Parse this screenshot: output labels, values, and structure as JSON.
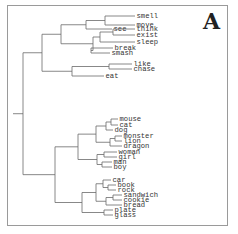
{
  "panel_label": "A",
  "tree": {
    "children": [
      {
        "children": [
          {
            "children": [
              {
                "children": [
                  {
                    "children": [
                      {
                        "label": "smell"
                      },
                      {
                        "label": "move"
                      }
                    ]
                  },
                  {
                    "label": "see"
                  }
                ]
              },
              {
                "children": [
                  {
                    "children": [
                      {
                        "children": [
                          {
                            "label": "think"
                          },
                          {
                            "label": "exist"
                          }
                        ]
                      },
                      {
                        "label": "sleep"
                      }
                    ]
                  },
                  {
                    "children": [
                      {
                        "label": "break"
                      },
                      {
                        "label": "smash"
                      }
                    ]
                  }
                ]
              }
            ]
          },
          {
            "children": [
              {
                "children": [
                  {
                    "label": "like"
                  },
                  {
                    "label": "chase"
                  }
                ]
              },
              {
                "label": "eat"
              }
            ]
          }
        ]
      },
      {
        "children": [
          {
            "children": [
              {
                "children": [
                  {
                    "children": [
                      {
                        "children": [
                          {
                            "label": "mouse"
                          },
                          {
                            "label": "cat"
                          }
                        ]
                      },
                      {
                        "label": "dog"
                      }
                    ]
                  },
                  {
                    "children": [
                      {
                        "children": [
                          {
                            "label": "monster"
                          },
                          {
                            "label": "lion"
                          }
                        ]
                      },
                      {
                        "label": "dragon"
                      }
                    ]
                  }
                ]
              },
              {
                "children": [
                  {
                    "children": [
                      {
                        "label": "woman"
                      },
                      {
                        "label": "girl"
                      }
                    ]
                  },
                  {
                    "children": [
                      {
                        "label": "man"
                      },
                      {
                        "label": "boy"
                      }
                    ]
                  }
                ]
              }
            ]
          },
          {
            "children": [
              {
                "children": [
                  {
                    "children": [
                      {
                        "label": "car"
                      },
                      {
                        "children": [
                          {
                            "label": "book"
                          },
                          {
                            "label": "rock"
                          }
                        ]
                      }
                    ]
                  },
                  {
                    "children": [
                      {
                        "children": [
                          {
                            "label": "sandwich"
                          },
                          {
                            "label": "cookie"
                          }
                        ]
                      },
                      {
                        "label": "bread"
                      }
                    ]
                  }
                ]
              },
              {
                "children": [
                  {
                    "label": "plate"
                  },
                  {
                    "label": "glass"
                  }
                ]
              }
            ]
          }
        ]
      }
    ]
  }
}
